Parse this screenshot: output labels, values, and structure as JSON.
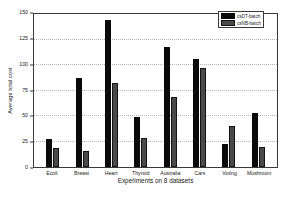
{
  "chart_data": {
    "type": "bar",
    "title": "",
    "xlabel": "Experiments on 8 datasets",
    "ylabel": "Average total cost",
    "categories": [
      "Ecoli",
      "Breast",
      "Heart",
      "Thyroid",
      "Australia",
      "Cars",
      "Voting",
      "Mushroom"
    ],
    "series": [
      {
        "name": "csDT-batch",
        "color": "#0a0a0a",
        "values": [
          27,
          87,
          144,
          49,
          118,
          106,
          23,
          53
        ]
      },
      {
        "name": "csNB-batch",
        "color": "#4a4a4a",
        "values": [
          19,
          16,
          82,
          28,
          69,
          97,
          40,
          20
        ]
      }
    ],
    "ylim": [
      0,
      150
    ],
    "yticks": [
      0,
      25,
      50,
      75,
      100,
      125,
      150
    ],
    "ytick_labels": [
      "0",
      "25",
      "50",
      "75",
      "100",
      "125",
      "150"
    ],
    "grid": true,
    "grid_style": "dotted-horizontal",
    "legend_position": "top-right",
    "frame": true
  }
}
